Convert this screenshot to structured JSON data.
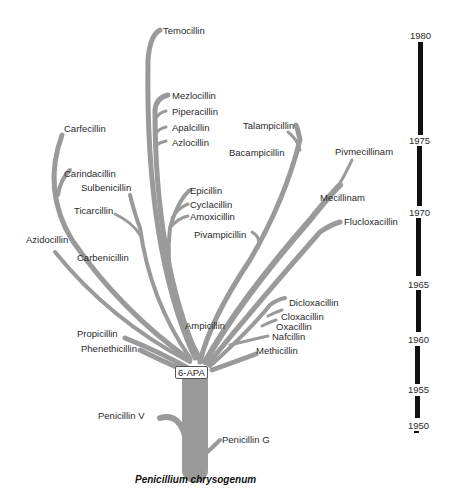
{
  "diagram": {
    "title": "",
    "root_caption": "Penicillium chrysogenum",
    "core_label": "6-APA",
    "branch_color": "#999999",
    "timeline_color": "#111111",
    "labels": {
      "temocillin": "Temocillin",
      "mezlocillin": "Mezlocillin",
      "piperacillin": "Piperacillin",
      "apalcillin": "Apalcillin",
      "azlocillin": "Azlocillin",
      "carfecillin": "Carfecillin",
      "carindacillin": "Carindacillin",
      "sulbenicillin": "Sulbenicillin",
      "ticarcillin": "Ticarcillin",
      "azidocillin": "Azidocillin",
      "carbenicillin": "Carbenicillin",
      "epicillin": "Epicillin",
      "cyclacillin": "Cyclacillin",
      "amoxicillin": "Amoxicillin",
      "pivampicillin": "Pivampicillin",
      "talampicillin": "Talampicillin",
      "bacampicillin": "Bacampicillin",
      "pivmecillinam": "Pivmecillinam",
      "mecillinam": "Mecillinam",
      "flucloxacillin": "Flucloxacillin",
      "dicloxacillin": "Dicloxacillin",
      "cloxacillin": "Cloxacillin",
      "oxacillin": "Oxacillin",
      "nafcillin": "Nafcillin",
      "methicillin": "Methicillin",
      "ampicillin": "Ampicillin",
      "propicillin": "Propicillin",
      "phenethicillin": "Phenethicillin",
      "penicillin_v": "Penicillin V",
      "penicillin_g": "Penicillin G"
    },
    "timeline": {
      "years": [
        "1980",
        "1975",
        "1970",
        "1965",
        "1960",
        "1955",
        "1950"
      ]
    }
  }
}
